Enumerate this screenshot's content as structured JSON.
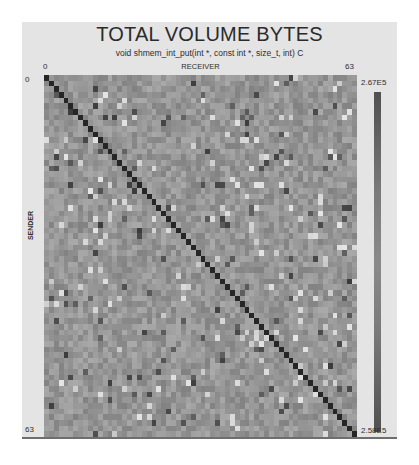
{
  "chart": {
    "title": "TOTAL VOLUME BYTES",
    "subtitle": "void shmem_int_put(int *, const int *, size_t, int) C",
    "x_axis_label": "RECEIVER",
    "y_axis_label": "SENDER",
    "x_ticks": [
      "0",
      "63"
    ],
    "y_ticks": [
      "0",
      "63"
    ],
    "colorbar": {
      "max_label": "2.67E5",
      "min_label": "2.58E5"
    }
  },
  "chart_data": {
    "type": "heatmap",
    "title": "TOTAL VOLUME BYTES",
    "subtitle": "void shmem_int_put(int *, const int *, size_t, int) C",
    "xlabel": "RECEIVER",
    "ylabel": "SENDER",
    "rows": 64,
    "cols": 64,
    "x_range": [
      0,
      63
    ],
    "y_range": [
      0,
      63
    ],
    "value_range": [
      258000,
      267000
    ],
    "colorbar_labels": {
      "max": "2.67E5",
      "min": "2.58E5"
    },
    "colormap": "grayscale (dark at both extremes, mid-gray center)",
    "diagonal": "dark (self-communication cells, near-extreme value)",
    "off_diagonal": "noisy values near the middle of the range, with scattered dark and light outliers",
    "legend_position": "right",
    "grid": false,
    "generator": {
      "seed": 1337,
      "base_gray": 150,
      "noise_spread": 34,
      "dark_outlier_rate": 0.035,
      "light_outlier_rate": 0.04,
      "diagonal_gray": 38
    }
  },
  "colors": {
    "panel_background": "#e4e4e4",
    "page_background": "#ffffff",
    "text": "#2e2e2e",
    "panel_border": "#6e6e6e"
  }
}
